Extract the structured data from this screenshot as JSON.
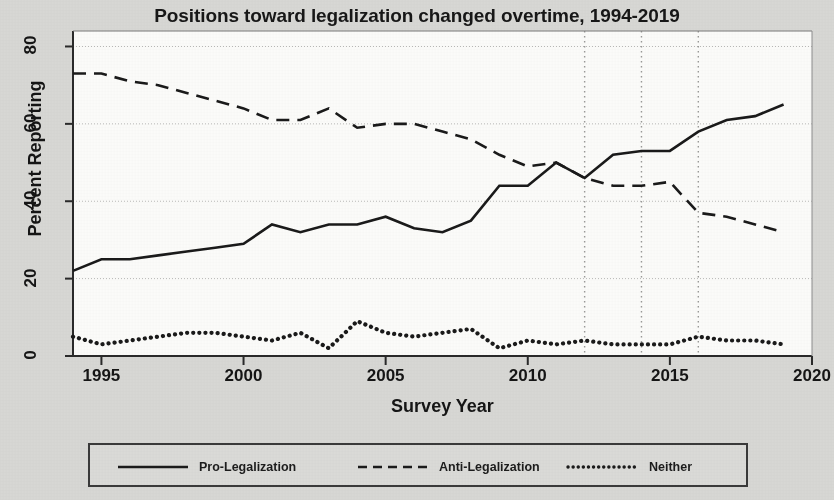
{
  "chart_data": {
    "type": "line",
    "title": "Positions toward legalization changed overtime, 1994-2019",
    "xlabel": "Survey Year",
    "ylabel": "Percent Reporting",
    "xlim": [
      1994,
      2020
    ],
    "ylim": [
      0,
      84
    ],
    "xticks": [
      1995,
      2000,
      2005,
      2010,
      2015,
      2020
    ],
    "yticks": [
      0,
      20,
      40,
      60,
      80
    ],
    "grid": true,
    "grid_axis": "y",
    "legend_position": "below-plot",
    "reference_lines": [
      {
        "x": 2012,
        "style": "dotted"
      },
      {
        "x": 2014,
        "style": "dotted"
      },
      {
        "x": 2016,
        "style": "dotted"
      }
    ],
    "x": [
      1994,
      1995,
      1996,
      1997,
      1998,
      1999,
      2000,
      2001,
      2002,
      2003,
      2004,
      2005,
      2006,
      2007,
      2008,
      2009,
      2010,
      2011,
      2012,
      2013,
      2014,
      2015,
      2016,
      2017,
      2018,
      2019
    ],
    "series": [
      {
        "name": "Pro-Legalization",
        "style": "solid",
        "color": "#1a1a1a",
        "values": [
          22,
          25,
          25,
          26,
          27,
          28,
          29,
          34,
          32,
          34,
          34,
          36,
          33,
          32,
          35,
          44,
          44,
          50,
          46,
          52,
          53,
          53,
          58,
          61,
          62,
          65
        ]
      },
      {
        "name": "Anti-Legalization",
        "style": "dashed",
        "color": "#1a1a1a",
        "values": [
          73,
          73,
          71,
          70,
          68,
          66,
          64,
          61,
          61,
          64,
          59,
          60,
          60,
          58,
          56,
          52,
          49,
          50,
          46,
          44,
          44,
          45,
          37,
          36,
          34,
          32
        ]
      },
      {
        "name": "Neither",
        "style": "dotted",
        "color": "#1a1a1a",
        "values": [
          5,
          3,
          4,
          5,
          6,
          6,
          5,
          4,
          6,
          2,
          9,
          6,
          5,
          6,
          7,
          2,
          4,
          3,
          4,
          3,
          3,
          3,
          5,
          4,
          4,
          3
        ]
      }
    ]
  },
  "legend": {
    "items": [
      {
        "label": "Pro-Legalization",
        "style": "solid"
      },
      {
        "label": "Anti-Legalization",
        "style": "dashed"
      },
      {
        "label": "Neither",
        "style": "dotted"
      }
    ]
  }
}
